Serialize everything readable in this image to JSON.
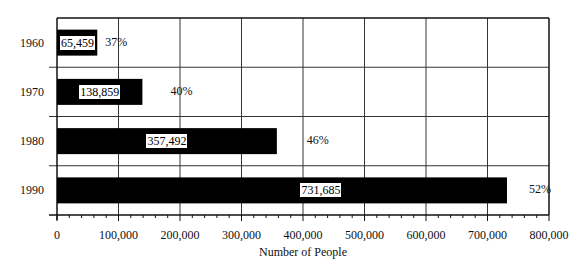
{
  "chart_data": {
    "type": "bar",
    "orientation": "horizontal",
    "title": "",
    "xlabel": "Number of People",
    "ylabel": "",
    "categories": [
      "1960",
      "1970",
      "1980",
      "1990"
    ],
    "values": [
      65459,
      138859,
      357492,
      731685
    ],
    "value_labels": [
      "65,459",
      "138,859",
      "357,492",
      "731,685"
    ],
    "percent_labels": [
      "37%",
      "40%",
      "46%",
      "52%"
    ],
    "xlim": [
      0,
      800000
    ],
    "x_ticks": [
      0,
      100000,
      200000,
      300000,
      400000,
      500000,
      600000,
      700000,
      800000
    ],
    "x_tick_labels": [
      "0",
      "100,000",
      "200,000",
      "300,000",
      "400,000",
      "500,000",
      "600,000",
      "700,000",
      "800,000"
    ],
    "grid": true,
    "minor_ticks_per_major": 5,
    "legend": null,
    "bar_color": "#000000"
  }
}
